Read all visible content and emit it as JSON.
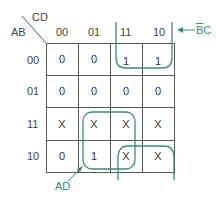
{
  "kmap": {
    "row_var": "AB",
    "col_var": "CD",
    "col_labels": [
      "00",
      "01",
      "11",
      "10"
    ],
    "row_labels": [
      "00",
      "01",
      "11",
      "10"
    ],
    "cells": [
      [
        "0",
        "0",
        "1",
        "1"
      ],
      [
        "0",
        "0",
        "0",
        "0"
      ],
      [
        "X",
        "X",
        "X",
        "X"
      ],
      [
        "0",
        "1",
        "X",
        "X"
      ]
    ],
    "groups": [
      {
        "label": "BC",
        "overbar": "B",
        "cells": "rows 00,11,10 ... columns 11,10",
        "color": "#3a8c7c"
      },
      {
        "label": "AD",
        "color": "#3a8c7c"
      }
    ]
  },
  "annotations": {
    "bc_label_bar": "B",
    "bc_label_rest": "C",
    "bc_arrow": "←",
    "ad_label": "AD"
  }
}
